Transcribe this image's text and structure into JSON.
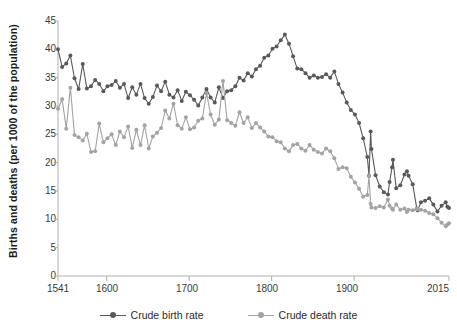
{
  "axes": {
    "y_title": "Births and deaths (per 1000 of the population)",
    "y_ticks": [
      "45",
      "40",
      "35",
      "30",
      "25",
      "20",
      "15",
      "10",
      "5",
      "0"
    ],
    "x_ticks": [
      "1541",
      "1600",
      "1700",
      "1800",
      "1900",
      "2015"
    ]
  },
  "legend": {
    "items": [
      {
        "label": "Crude birth rate",
        "color": "#595959"
      },
      {
        "label": "Crude death rate",
        "color": "#a3a3a3"
      }
    ]
  },
  "colors": {
    "birth": "#595959",
    "death": "#a3a3a3",
    "axis": "#b0b0b0",
    "text": "#3a3a3a",
    "background": "#ffffff"
  },
  "chart_data": {
    "type": "line",
    "title": "",
    "subtitle": "",
    "xlabel": "",
    "ylabel": "Births and deaths (per 1000 of the population)",
    "xlim": [
      1541,
      2015
    ],
    "ylim": [
      0,
      45
    ],
    "ytick_values": [
      0,
      5,
      10,
      15,
      20,
      25,
      30,
      35,
      40,
      45
    ],
    "xtick_values": [
      1541,
      1600,
      1700,
      1800,
      1900,
      2015
    ],
    "grid": false,
    "legend_position": "bottom",
    "series": [
      {
        "name": "Crude birth rate",
        "color": "#595959",
        "x": [
          1541,
          1546,
          1551,
          1556,
          1561,
          1566,
          1571,
          1576,
          1581,
          1586,
          1591,
          1596,
          1601,
          1606,
          1611,
          1616,
          1621,
          1626,
          1631,
          1636,
          1641,
          1646,
          1651,
          1656,
          1661,
          1666,
          1671,
          1676,
          1681,
          1686,
          1691,
          1696,
          1701,
          1706,
          1711,
          1716,
          1721,
          1726,
          1731,
          1736,
          1741,
          1746,
          1751,
          1756,
          1761,
          1766,
          1771,
          1776,
          1781,
          1786,
          1791,
          1796,
          1801,
          1806,
          1811,
          1816,
          1821,
          1826,
          1831,
          1836,
          1841,
          1846,
          1851,
          1856,
          1861,
          1866,
          1871,
          1876,
          1881,
          1886,
          1891,
          1896,
          1901,
          1906,
          1911,
          1916,
          1918,
          1920,
          1921,
          1926,
          1931,
          1936,
          1941,
          1943,
          1946,
          1947,
          1951,
          1956,
          1961,
          1964,
          1966,
          1971,
          1976,
          1977,
          1981,
          1986,
          1991,
          1996,
          2001,
          2006,
          2011,
          2013,
          2015
        ],
        "y": [
          40.0,
          36.9,
          37.5,
          38.9,
          34.9,
          33.0,
          37.4,
          33.1,
          33.5,
          34.6,
          33.9,
          32.6,
          33.5,
          33.7,
          34.4,
          33.2,
          33.9,
          31.4,
          33.3,
          32.0,
          33.9,
          31.4,
          30.4,
          31.6,
          33.6,
          32.6,
          34.3,
          32.0,
          31.5,
          32.8,
          30.9,
          32.5,
          31.9,
          31.1,
          30.1,
          31.5,
          33.0,
          31.5,
          30.6,
          33.3,
          31.4,
          32.6,
          32.8,
          33.5,
          35.0,
          34.5,
          35.8,
          35.2,
          36.5,
          37.1,
          38.5,
          38.9,
          40.1,
          40.5,
          41.6,
          42.6,
          41.0,
          38.8,
          36.6,
          36.5,
          35.8,
          35.0,
          35.4,
          35.0,
          35.1,
          35.6,
          35.0,
          36.1,
          33.9,
          32.4,
          30.6,
          29.3,
          28.5,
          27.0,
          24.3,
          21.0,
          17.7,
          25.5,
          22.4,
          17.8,
          15.8,
          14.8,
          14.4,
          16.6,
          19.2,
          20.5,
          15.5,
          16.0,
          17.9,
          18.5,
          17.7,
          16.2,
          11.9,
          11.6,
          13.0,
          13.3,
          13.7,
          12.6,
          11.4,
          12.4,
          13.0,
          12.2,
          12.0
        ]
      },
      {
        "name": "Crude death rate",
        "color": "#a3a3a3",
        "x": [
          1541,
          1546,
          1551,
          1556,
          1561,
          1566,
          1571,
          1576,
          1581,
          1586,
          1591,
          1596,
          1601,
          1606,
          1611,
          1616,
          1621,
          1626,
          1631,
          1636,
          1641,
          1646,
          1651,
          1656,
          1661,
          1666,
          1671,
          1676,
          1681,
          1686,
          1691,
          1696,
          1701,
          1706,
          1711,
          1716,
          1721,
          1726,
          1731,
          1736,
          1741,
          1746,
          1751,
          1756,
          1761,
          1766,
          1771,
          1776,
          1781,
          1786,
          1791,
          1796,
          1801,
          1806,
          1811,
          1816,
          1821,
          1826,
          1831,
          1836,
          1841,
          1846,
          1851,
          1856,
          1861,
          1866,
          1871,
          1876,
          1881,
          1886,
          1891,
          1896,
          1901,
          1906,
          1911,
          1916,
          1918,
          1920,
          1921,
          1926,
          1931,
          1936,
          1941,
          1943,
          1946,
          1947,
          1951,
          1956,
          1961,
          1964,
          1966,
          1971,
          1976,
          1977,
          1981,
          1986,
          1991,
          1996,
          2001,
          2006,
          2011,
          2013,
          2015
        ],
        "y": [
          29.5,
          31.2,
          26.0,
          33.2,
          24.9,
          24.5,
          23.9,
          25.1,
          21.9,
          22.0,
          26.9,
          23.6,
          24.3,
          25.0,
          23.1,
          25.5,
          24.5,
          26.4,
          22.6,
          25.8,
          23.1,
          26.6,
          22.5,
          24.6,
          25.3,
          26.1,
          29.2,
          27.8,
          30.4,
          26.6,
          26.0,
          28.0,
          25.9,
          26.2,
          27.4,
          27.8,
          32.3,
          28.5,
          26.7,
          27.6,
          34.4,
          27.5,
          27.0,
          26.5,
          28.9,
          27.0,
          28.0,
          26.1,
          27.0,
          26.2,
          25.5,
          24.6,
          24.5,
          23.8,
          23.6,
          22.5,
          22.0,
          23.1,
          23.3,
          22.5,
          22.1,
          23.1,
          22.3,
          21.9,
          21.6,
          22.5,
          22.0,
          20.8,
          18.9,
          19.2,
          19.0,
          17.5,
          16.5,
          15.4,
          14.0,
          14.3,
          17.7,
          12.7,
          12.1,
          12.0,
          12.3,
          12.1,
          13.5,
          12.4,
          11.9,
          11.7,
          12.6,
          11.7,
          11.9,
          11.3,
          11.7,
          11.6,
          11.9,
          11.8,
          11.7,
          11.5,
          11.1,
          10.9,
          10.2,
          9.4,
          8.8,
          9.1,
          9.3
        ]
      }
    ]
  }
}
